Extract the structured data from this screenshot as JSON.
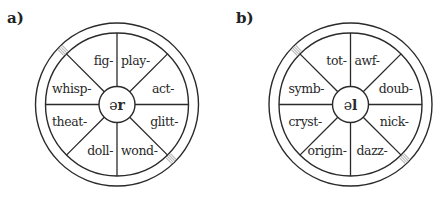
{
  "colors": {
    "line": "#2a2a2a",
    "hatch": "#b5b5b5",
    "background": "#ffffff"
  },
  "wheels": [
    {
      "label": "a)",
      "hub_prefix": "ə",
      "hub_suffix": "r",
      "center": [
        117,
        104.5
      ],
      "segments": {
        "top_left": "fig-",
        "top_right": "play-",
        "upper_right": "act-",
        "lower_right": "glitt-",
        "bottom_right": "wond-",
        "bottom_left": "doll-",
        "lower_left": "theat-",
        "upper_left": "whisp-"
      }
    },
    {
      "label": "b)",
      "hub_prefix": "ə",
      "hub_suffix": "l",
      "center": [
        350.5,
        104.5
      ],
      "segments": {
        "top_left": "tot-",
        "top_right": "awf-",
        "upper_right": "doub-",
        "lower_right": "nick-",
        "bottom_right": "dazz-",
        "bottom_left": "origin-",
        "lower_left": "cryst-",
        "upper_left": "symb-"
      }
    }
  ]
}
